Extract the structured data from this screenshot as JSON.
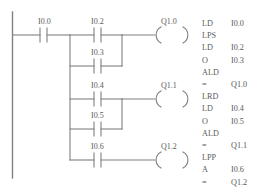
{
  "diagram": {
    "type": "plc-ladder-diagram",
    "title": "",
    "stroke_color": "#808080",
    "text_color": "#5a5a5a",
    "background": "#ffffff",
    "power_rail": {
      "label": "left-power-rail"
    },
    "rungs": [
      {
        "name": "rung-1",
        "series_contact": {
          "label": "I0.0",
          "type": "normally-open"
        },
        "parallel_contacts": [
          {
            "label": "I0.2",
            "type": "normally-open"
          },
          {
            "label": "I0.3",
            "type": "normally-open"
          }
        ],
        "coil": {
          "label": "Q1.0",
          "type": "output-coil"
        }
      },
      {
        "name": "rung-2",
        "series_contact": null,
        "parallel_contacts": [
          {
            "label": "I0.4",
            "type": "normally-open"
          },
          {
            "label": "I0.5",
            "type": "normally-open"
          }
        ],
        "coil": {
          "label": "Q1.1",
          "type": "output-coil"
        }
      },
      {
        "name": "rung-3",
        "series_contact": null,
        "parallel_contacts": [
          {
            "label": "I0.6",
            "type": "normally-open"
          }
        ],
        "coil": {
          "label": "Q1.2",
          "type": "output-coil"
        }
      }
    ],
    "contact_labels": [
      {
        "id": "c-i00",
        "text": "I0.0",
        "x": 38,
        "y": 18
      },
      {
        "id": "c-i02",
        "text": "I0.2",
        "x": 91,
        "y": 18
      },
      {
        "id": "c-i03",
        "text": "I0.3",
        "x": 91,
        "y": 51
      },
      {
        "id": "c-i04",
        "text": "I0.4",
        "x": 91,
        "y": 82
      },
      {
        "id": "c-i05",
        "text": "I0.5",
        "x": 91,
        "y": 112
      },
      {
        "id": "c-i06",
        "text": "I0.6",
        "x": 91,
        "y": 145
      }
    ],
    "coil_labels": [
      {
        "id": "k-q10",
        "text": "Q1.0",
        "x": 160,
        "y": 18
      },
      {
        "id": "k-q11",
        "text": "Q1.1",
        "x": 160,
        "y": 82
      },
      {
        "id": "k-q12",
        "text": "Q1.2",
        "x": 160,
        "y": 145
      }
    ]
  },
  "instruction_list": {
    "name": "statement-list-program",
    "column_x": {
      "mnemonic": 202,
      "operand": 231
    },
    "start_y": 20,
    "line_height": 12.2,
    "lines": [
      {
        "mnemonic": "LD",
        "operand": "I0.0"
      },
      {
        "mnemonic": "LPS",
        "operand": ""
      },
      {
        "mnemonic": "LD",
        "operand": "I0.2"
      },
      {
        "mnemonic": "O",
        "operand": "I0.3"
      },
      {
        "mnemonic": "ALD",
        "operand": ""
      },
      {
        "mnemonic": "=",
        "operand": "Q1.0"
      },
      {
        "mnemonic": "LRD",
        "operand": ""
      },
      {
        "mnemonic": "LD",
        "operand": "I0.4"
      },
      {
        "mnemonic": "O",
        "operand": "I0.5"
      },
      {
        "mnemonic": "ALD",
        "operand": ""
      },
      {
        "mnemonic": "=",
        "operand": "Q1.1"
      },
      {
        "mnemonic": "LPP",
        "operand": ""
      },
      {
        "mnemonic": "A",
        "operand": "I0.6"
      },
      {
        "mnemonic": "=",
        "operand": "Q1.2"
      }
    ]
  }
}
